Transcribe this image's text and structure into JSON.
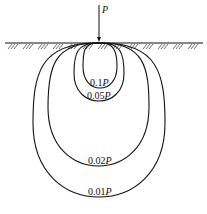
{
  "diagram": {
    "type": "pressure-bulb",
    "load": {
      "label": "P",
      "x": 99,
      "arrow_top": 5,
      "arrow_bottom": 42
    },
    "ground": {
      "y": 43,
      "x1": 5,
      "x2": 203
    },
    "colors": {
      "line": "#111111",
      "background": "#ffffff"
    },
    "bulbs": [
      {
        "label_value": "0.1",
        "label_unit": "P",
        "label": "0.1P",
        "left": 83,
        "right": 117,
        "bottom": 88,
        "label_x": 90,
        "label_y": 86
      },
      {
        "label_value": "0.05",
        "label_unit": "P",
        "label": "0.05P",
        "left": 74,
        "right": 124,
        "bottom": 101,
        "label_x": 87,
        "label_y": 99
      },
      {
        "label_value": "0.02",
        "label_unit": "P",
        "label": "0.02P",
        "left": 48,
        "right": 149,
        "bottom": 166,
        "label_x": 88,
        "label_y": 164
      },
      {
        "label_value": "0.01",
        "label_unit": "P",
        "label": "0.01P",
        "left": 33,
        "right": 165,
        "bottom": 197,
        "label_x": 88,
        "label_y": 195
      }
    ]
  }
}
